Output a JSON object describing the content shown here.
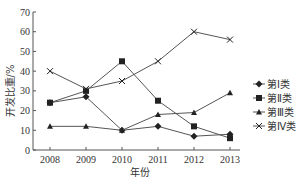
{
  "chart_data": {
    "type": "line",
    "title": "",
    "xlabel": "年份",
    "ylabel": "开发比重/%",
    "x": [
      "2008",
      "2009",
      "2010",
      "2011",
      "2012",
      "2013"
    ],
    "ylim": [
      0,
      70
    ],
    "yticks": [
      0,
      10,
      20,
      30,
      40,
      50,
      60,
      70
    ],
    "grid": false,
    "legend_position": "right",
    "series": [
      {
        "name": "第Ⅰ类",
        "marker": "diamond",
        "values": [
          24,
          27,
          10,
          12,
          7,
          8
        ]
      },
      {
        "name": "第Ⅱ类",
        "marker": "square",
        "values": [
          24,
          30,
          45,
          25,
          12,
          6
        ]
      },
      {
        "name": "第Ⅲ类",
        "marker": "triangle",
        "values": [
          12,
          12,
          10,
          18,
          19,
          29
        ]
      },
      {
        "name": "第Ⅳ类",
        "marker": "x",
        "values": [
          40,
          31,
          35,
          45,
          60,
          56
        ]
      }
    ]
  },
  "colors": {
    "line": "#555555",
    "marker": "#222222",
    "axis": "#555555"
  }
}
